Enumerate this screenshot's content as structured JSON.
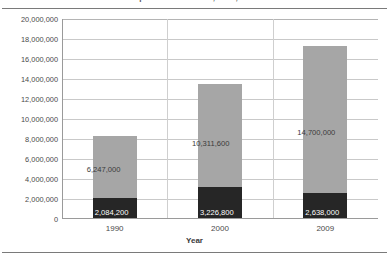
{
  "figure": {
    "title": "Net Liquid Assets in 1990, 2000, and 2009"
  },
  "chart_data": {
    "type": "bar",
    "stacked": true,
    "title": "Net Liquid Assets in 1990, 2000, and 2009",
    "xlabel": "Year",
    "ylabel": "",
    "categories": [
      "1990",
      "2000",
      "2009"
    ],
    "ylim": [
      0,
      20000000
    ],
    "ytick_step": 2000000,
    "grid": true,
    "legend": "none",
    "ytick_labels": [
      "20,000,000",
      "18,000,000",
      "16,000,000",
      "14,000,000",
      "12,000,000",
      "10,000,000",
      "8,000,000",
      "6,000,000",
      "4,000,000",
      "2,000,000",
      "0"
    ],
    "series": [
      {
        "name": "lower",
        "color": "#262626",
        "values": [
          2084200,
          3226800,
          2638000
        ],
        "labels": [
          "2,084,200",
          "3,226,800",
          "2,638,000"
        ]
      },
      {
        "name": "upper",
        "color": "#a6a6a6",
        "values": [
          6247000,
          10311600,
          14700000
        ],
        "labels": [
          "6,247,000",
          "10,311,600",
          "14,700,000"
        ]
      }
    ],
    "totals": [
      8331200,
      13538400,
      17338000
    ]
  }
}
